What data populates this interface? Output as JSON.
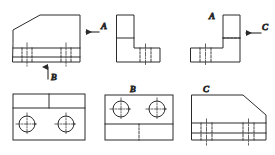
{
  "drawing": {
    "title": "Orthographic projection exercise — six views of a bracket",
    "background_color": "#ffffff",
    "line_color": "#2a2a2a",
    "centerline_color": "#3a3a3a",
    "stroke_width": 1,
    "labels": {
      "view_a": "A",
      "view_b": "B",
      "view_c": "C",
      "arrow_a": "A",
      "arrow_b": "B",
      "arrow_c": "C"
    },
    "views": [
      {
        "id": "front-view",
        "name": "front-view",
        "position": "top-left",
        "description": "Front elevation with upper-left chamfer and stepped base plate",
        "label": "",
        "arrows": [
          {
            "label": "A",
            "direction": "left",
            "name": "view-arrow-a"
          },
          {
            "label": "B",
            "direction": "up",
            "name": "view-arrow-b"
          }
        ],
        "hidden_edges": 4,
        "center_lines": 2
      },
      {
        "id": "side-view-l",
        "name": "l-shaped-side-view",
        "position": "top-center",
        "description": "L-shaped side elevation, vertical leg upper-left, foot to the right",
        "label": "",
        "arrows": [],
        "hidden_edges": 2,
        "center_lines": 1
      },
      {
        "id": "view-a",
        "name": "view-a-projection",
        "position": "top-right",
        "description": "Mirrored L-shaped view looking in direction A, foot to the left",
        "label": "A",
        "arrows": [
          {
            "label": "C",
            "direction": "left",
            "name": "view-arrow-c"
          }
        ],
        "hidden_edges": 3,
        "center_lines": 1
      },
      {
        "id": "top-view",
        "name": "top-view-plan",
        "position": "bottom-left",
        "description": "Plan view: rectangle with upper strip divided by a vertical edge and two through holes",
        "label": "",
        "arrows": [],
        "holes": 2,
        "center_lines": 2
      },
      {
        "id": "view-b",
        "name": "view-b-projection",
        "position": "bottom-center",
        "description": "View in direction B: two through holes above, base strip below split by a hidden line",
        "label": "B",
        "arrows": [],
        "holes": 2,
        "hidden_edges": 1,
        "center_lines": 2
      },
      {
        "id": "view-c",
        "name": "view-c-projection",
        "position": "bottom-right",
        "description": "View in direction C: body with upper-right chamfer over a stepped base plate",
        "label": "C",
        "arrows": [],
        "hidden_edges": 4,
        "center_lines": 2
      }
    ]
  }
}
